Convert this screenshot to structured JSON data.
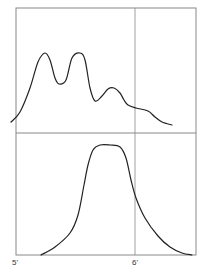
{
  "chart_data": [
    {
      "type": "line",
      "panel": "top",
      "title": "",
      "xlabel": "",
      "ylabel": "",
      "grid": false,
      "description": "Multi-peaked distribution curve with three peaks and a trailing shoulder",
      "x_range": [
        "5'",
        "6'+"
      ],
      "points": [
        [
          11,
          122
        ],
        [
          20,
          112
        ],
        [
          30,
          88
        ],
        [
          38,
          62
        ],
        [
          45,
          53
        ],
        [
          50,
          60
        ],
        [
          55,
          78
        ],
        [
          59,
          84
        ],
        [
          66,
          80
        ],
        [
          72,
          58
        ],
        [
          80,
          53
        ],
        [
          85,
          60
        ],
        [
          90,
          88
        ],
        [
          95,
          101
        ],
        [
          102,
          96
        ],
        [
          108,
          89
        ],
        [
          114,
          88
        ],
        [
          120,
          93
        ],
        [
          124,
          100
        ],
        [
          128,
          105
        ],
        [
          136,
          108
        ],
        [
          148,
          111
        ],
        [
          155,
          117
        ],
        [
          162,
          122
        ],
        [
          172,
          125
        ]
      ]
    },
    {
      "type": "line",
      "panel": "bottom",
      "title": "",
      "xlabel": "",
      "ylabel": "",
      "grid": false,
      "description": "Single-peaked bell-like distribution with flat top",
      "points": [
        [
          41,
          255
        ],
        [
          55,
          247
        ],
        [
          70,
          233
        ],
        [
          78,
          215
        ],
        [
          84,
          185
        ],
        [
          88,
          165
        ],
        [
          93,
          150
        ],
        [
          100,
          145
        ],
        [
          110,
          145
        ],
        [
          120,
          147
        ],
        [
          126,
          158
        ],
        [
          131,
          180
        ],
        [
          136,
          198
        ],
        [
          145,
          218
        ],
        [
          158,
          236
        ],
        [
          170,
          247
        ],
        [
          182,
          253
        ],
        [
          192,
          255
        ]
      ]
    }
  ],
  "axis": {
    "tick_labels": [
      "5'",
      "6'"
    ]
  },
  "colors": {
    "frame": "#777777",
    "curve": "#222222",
    "label": "#333333"
  }
}
